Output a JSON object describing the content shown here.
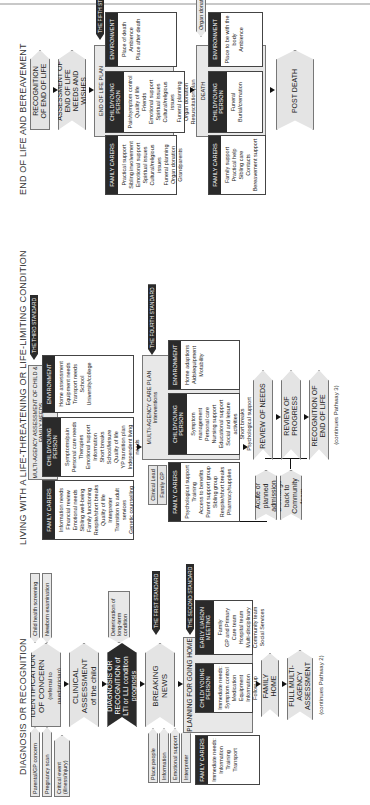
{
  "sections": [
    {
      "title": "DIAGNOSIS OR RECOGNITION",
      "triggers": [
        "Parental/GP concern",
        "Pregnancy scan",
        "Critical event (illness/injury)"
      ],
      "screening_tags": [
        "Child health screening",
        "Newborn examination"
      ],
      "steps": [
        {
          "label": "IDENTIFICATION OF CONCERN",
          "sub": "(referral to paediatrician)"
        },
        {
          "label": "CLINICAL ASSESSMENT",
          "sub": "of the child"
        },
        {
          "label": "DIAGNOSIS OR RECOGNITION of LTI or LLI condition prognosis",
          "sub": ""
        },
        {
          "label": "BREAKING NEWS",
          "sub": ""
        },
        {
          "label": "PLANNING FOR GOING HOME",
          "sub": ""
        },
        {
          "label": "FAMILY HOME",
          "sub": ""
        },
        {
          "label": "FULL MULTI-AGENCY ASSESSMENT",
          "sub": ""
        }
      ],
      "deterioration_tag": "Deterioration of long-term condition",
      "breaking_news_tags": [
        "Place people",
        "Information",
        "Emotional support",
        "Interpreter"
      ],
      "standards": [
        "THE FIRST STANDARD",
        "THE SECOND STANDARD"
      ],
      "columns": [
        {
          "head": "FAMILY CARERS",
          "items": [
            "Immediate needs:",
            "Information",
            "Training",
            "Transport"
          ]
        },
        {
          "head": "CHILD/ YOUNG PERSON",
          "items": [
            "Immediate needs:",
            "Symptom control",
            "Medication",
            "Equipment",
            "Information",
            "Follow-up"
          ]
        },
        {
          "head": "EARLY LIAISON MEETING",
          "items": [
            "Family",
            "GP and Primary Care team",
            "Hospital team",
            "Multi-disciplinary Community team",
            "Social Services"
          ]
        }
      ],
      "continues": "(continues Pathway 2)"
    },
    {
      "title": "LIVING WITH A LIFE-THREATENING OR LIFE-LIMITING CONDITION",
      "assessment_label": "MULTI-AGENCY ASSESSMENT OF CHILD & FAMILY NEEDS",
      "standard_3": "THE THIRD STANDARD",
      "assessment_columns": [
        {
          "head": "FAMILY CARERS",
          "items": [
            "Information needs",
            "Financial review",
            "Emotional needs",
            "Sibling well-being",
            "Family functioning",
            "Respite/short breaks",
            "Quality of life",
            "Interpreter",
            "Transition to adult services",
            "Genetic counselling"
          ]
        },
        {
          "head": "CHILD/YOUNG PERSON",
          "items": [
            "Symptoms/pain",
            "Personal care needs",
            "Therapies",
            "Emotional support",
            "Information",
            "Short breaks",
            "School/leisure",
            "Quality of life",
            "YP transition plan",
            "Independent living needs"
          ]
        },
        {
          "head": "ENVIRONMENT",
          "items": [
            "Home assessment",
            "Equipment needs",
            "Transport needs",
            "School",
            "University/college"
          ]
        }
      ],
      "clinical_lead": "Clinical Lead",
      "family_gp": "Family GP",
      "care_plan_label": "MULTI-AGENCY CARE PLAN",
      "care_plan_sub": "Interventions",
      "standard_4": "THE FOURTH STANDARD",
      "care_plan_columns": [
        {
          "head": "FAMILY CARERS",
          "items": [
            "Psychological support",
            "Training",
            "Access to benefits",
            "Parent support group",
            "Sibling group",
            "Respite/short breaks",
            "Pharmacy/supplies"
          ]
        },
        {
          "head": "CHILD/YOUNG PERSON",
          "items": [
            "Symptom management",
            "Personal care",
            "Nursing support",
            "Educational support",
            "Social and leisure activities",
            "Short breaks",
            "Psychological support",
            "Independent living advice (YP)"
          ]
        },
        {
          "head": "ENVIRONMENT",
          "items": [
            "Home adaptions",
            "Aids/equipment",
            "Motability"
          ]
        }
      ],
      "admission": "Acute or planned admission",
      "discharge": "Discharge back to Community team",
      "steps": [
        "REVIEW OF NEEDS",
        "REVIEW OF PROGRESS",
        "RECOGNITION OF END OF LIFE"
      ],
      "continues": "(continues Pathway 3)"
    },
    {
      "title": "END OF LIFE AND BEREAVEMENT",
      "steps": [
        "RECOGNITION OF END OF LIFE",
        "ASSESSMENT OF END OF LIFE NEEDS AND WISHES",
        "END OF LIFE PLAN",
        "DEATH",
        "POST DEATH"
      ],
      "standard_5": "THE FIFTH STANDARD",
      "plan_columns": [
        {
          "head": "FAMILY CARERS",
          "items": [
            "Practical support",
            "Sibling involvement",
            "Emotional support",
            "Spiritual issues",
            "Cultural/religious issues",
            "Funeral planning",
            "Organ donation",
            "Grandparents"
          ]
        },
        {
          "head": "CHILD/YOUNG PERSON",
          "items": [
            "Pain/symptom control",
            "Quality of life",
            "Friends",
            "Emotional support",
            "Spiritual issues",
            "Cultural/religious issues",
            "Funeral planning",
            "Organ donation",
            "Resuscitation plan",
            "Special wishes/visits",
            "Memory box"
          ]
        },
        {
          "head": "ENVIRONMENT",
          "items": [
            "Place of death",
            "Ambience",
            "Place after death"
          ]
        }
      ],
      "organ_donation": "Organ donation",
      "death_columns": [
        {
          "head": "FAMILY CARERS",
          "items": [
            "Family support",
            "Practical help",
            "Sibling care",
            "Contacts",
            "Bereavement support"
          ]
        },
        {
          "head": "CHILD/YOUNG PERSON",
          "items": [
            "Funeral",
            "Burial/cremation"
          ]
        },
        {
          "head": "ENVIRONMENT",
          "items": [
            "Place to be with the body",
            "Ambience"
          ]
        }
      ]
    }
  ]
}
